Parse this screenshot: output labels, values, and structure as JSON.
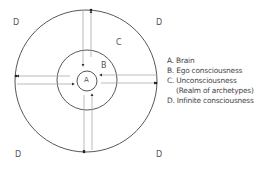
{
  "diagram": {
    "corner_labels": [
      "D",
      "D",
      "D",
      "D"
    ],
    "region_labels": {
      "a": "A",
      "b": "B",
      "c": "C"
    },
    "legend": [
      "A. Brain",
      "B. Ego consciousness",
      "C. Unconsciousness",
      "(Realm of archetypes)",
      "D. Infinite consciousness"
    ],
    "colors": {
      "circle": "#333333",
      "arrow_line": "#999999",
      "text": "#555555"
    }
  }
}
